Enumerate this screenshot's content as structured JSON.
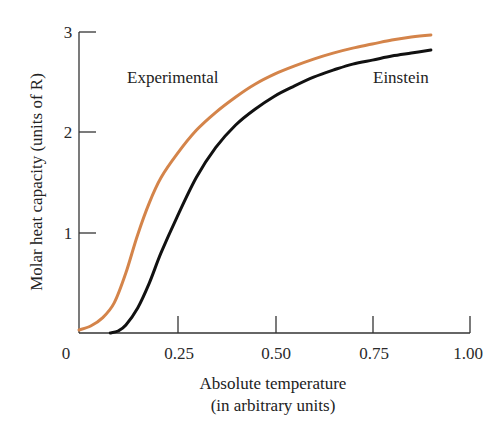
{
  "chart_data": {
    "type": "line",
    "title": "",
    "xlabel": "Absolute temperature",
    "xlabel_sub": "(in arbitrary units)",
    "ylabel": "Molar heat capacity (units of R)",
    "xlim": [
      0,
      1.0
    ],
    "ylim": [
      0,
      3
    ],
    "xticks": [
      "0",
      "0.25",
      "0.50",
      "0.75",
      "1.00"
    ],
    "yticks": [
      "1",
      "2",
      "3"
    ],
    "grid": false,
    "legend": "inline labels",
    "series": [
      {
        "name": "Experimental",
        "color": "#d4844a",
        "x": [
          0.0,
          0.03,
          0.06,
          0.09,
          0.12,
          0.15,
          0.18,
          0.21,
          0.25,
          0.3,
          0.35,
          0.4,
          0.45,
          0.5,
          0.55,
          0.6,
          0.65,
          0.7,
          0.75,
          0.8,
          0.85,
          0.9
        ],
        "y": [
          0.03,
          0.07,
          0.15,
          0.3,
          0.6,
          0.98,
          1.3,
          1.55,
          1.78,
          2.02,
          2.2,
          2.35,
          2.48,
          2.58,
          2.66,
          2.73,
          2.79,
          2.84,
          2.88,
          2.92,
          2.95,
          2.97
        ]
      },
      {
        "name": "Einstein",
        "color": "#111111",
        "x": [
          0.08,
          0.1,
          0.12,
          0.15,
          0.18,
          0.21,
          0.25,
          0.3,
          0.35,
          0.4,
          0.45,
          0.5,
          0.55,
          0.6,
          0.65,
          0.7,
          0.75,
          0.8,
          0.85,
          0.9
        ],
        "y": [
          0.0,
          0.02,
          0.08,
          0.25,
          0.5,
          0.8,
          1.15,
          1.55,
          1.85,
          2.07,
          2.23,
          2.36,
          2.46,
          2.55,
          2.62,
          2.68,
          2.72,
          2.76,
          2.79,
          2.82
        ]
      }
    ],
    "annotations": [
      {
        "text": "Experimental",
        "x": 0.15,
        "y": 2.55
      },
      {
        "text": "Einstein",
        "x": 0.8,
        "y": 2.55
      }
    ]
  }
}
